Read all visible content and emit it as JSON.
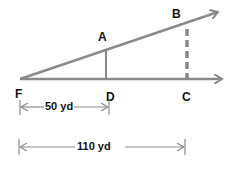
{
  "diagram": {
    "points": {
      "F": "F",
      "A": "A",
      "B": "B",
      "C": "C",
      "D": "D"
    },
    "dimensions": {
      "FD": "50 yd",
      "FC": "110 yd"
    },
    "colors": {
      "line": "#8a8a8a",
      "text": "#111111",
      "background": "#ffffff"
    }
  }
}
